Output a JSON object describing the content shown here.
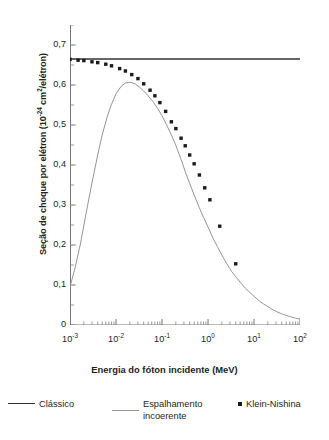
{
  "chart_data": {
    "type": "line",
    "title": "",
    "xlabel": "Energia do fóton incidente (MeV)",
    "ylabel_prefix": "Seção de choque por elétron (10",
    "ylabel_exponent": "-24",
    "ylabel_suffix": " cm2/elétron)",
    "ylabel_full": "Seção de choque por elétron (10-24 cm2/elétron)",
    "xscale": "log",
    "yscale": "linear",
    "xlim": [
      0.001,
      100
    ],
    "ylim": [
      0,
      0.75
    ],
    "grid": false,
    "legend_position": "below",
    "y_ticks": [
      {
        "value": 0,
        "label": "0"
      },
      {
        "value": 0.1,
        "label": "0,1"
      },
      {
        "value": 0.2,
        "label": "0,2"
      },
      {
        "value": 0.3,
        "label": "0,3"
      },
      {
        "value": 0.4,
        "label": "0,4"
      },
      {
        "value": 0.5,
        "label": "0,5"
      },
      {
        "value": 0.6,
        "label": "0,6"
      },
      {
        "value": 0.7,
        "label": "0,7"
      }
    ],
    "y_minor_ticks": [
      0.05,
      0.15,
      0.25,
      0.35,
      0.45,
      0.55,
      0.65,
      0.75
    ],
    "x_ticks": [
      {
        "value": 0.001,
        "mantissa": "10",
        "exponent": "-3"
      },
      {
        "value": 0.01,
        "mantissa": "10",
        "exponent": "-2"
      },
      {
        "value": 0.1,
        "mantissa": "10",
        "exponent": "-1"
      },
      {
        "value": 1,
        "mantissa": "10",
        "exponent": "0"
      },
      {
        "value": 10,
        "mantissa": "10",
        "exponent": "1"
      },
      {
        "value": 100,
        "mantissa": "10",
        "exponent": "2"
      }
    ],
    "series": [
      {
        "name": "Clássico",
        "style": "line",
        "color": "#333333",
        "width": 1.6,
        "x": [
          0.001,
          100
        ],
        "values": [
          0.665,
          0.665
        ]
      },
      {
        "name": "Espalhamento incoerente",
        "style": "line",
        "color": "#969696",
        "width": 1.0,
        "x": [
          0.001,
          0.0013,
          0.0017,
          0.0022,
          0.003,
          0.004,
          0.005,
          0.0065,
          0.008,
          0.01,
          0.013,
          0.016,
          0.02,
          0.026,
          0.033,
          0.04,
          0.05,
          0.065,
          0.08,
          0.1,
          0.13,
          0.16,
          0.2,
          0.26,
          0.33,
          0.4,
          0.5,
          0.65,
          0.8,
          1.0,
          1.3,
          1.6,
          2.0,
          2.6,
          3.3,
          4.0,
          5.0,
          6.5,
          8.0,
          10.0,
          13.0,
          16.0,
          20.0,
          26.0,
          33.0,
          40.0,
          50.0,
          65.0,
          80.0,
          100.0
        ],
        "values": [
          0.095,
          0.145,
          0.205,
          0.275,
          0.355,
          0.425,
          0.475,
          0.522,
          0.552,
          0.578,
          0.597,
          0.605,
          0.607,
          0.603,
          0.594,
          0.585,
          0.573,
          0.557,
          0.542,
          0.523,
          0.497,
          0.475,
          0.449,
          0.414,
          0.379,
          0.354,
          0.325,
          0.293,
          0.269,
          0.245,
          0.216,
          0.196,
          0.175,
          0.152,
          0.133,
          0.121,
          0.107,
          0.092,
          0.082,
          0.072,
          0.06,
          0.053,
          0.046,
          0.038,
          0.032,
          0.028,
          0.024,
          0.02,
          0.017,
          0.015
        ]
      },
      {
        "name": "Klein-Nishina",
        "style": "markers",
        "color": "#1a1a1a",
        "marker": "square",
        "marker_size": 3.4,
        "x": [
          0.001,
          0.0015,
          0.002,
          0.003,
          0.004,
          0.006,
          0.008,
          0.012,
          0.016,
          0.022,
          0.03,
          0.04,
          0.055,
          0.07,
          0.09,
          0.12,
          0.16,
          0.2,
          0.26,
          0.32,
          0.4,
          0.5,
          0.65,
          0.85,
          1.1,
          1.8,
          4.0
        ],
        "values": [
          0.664,
          0.662,
          0.661,
          0.658,
          0.656,
          0.652,
          0.648,
          0.641,
          0.635,
          0.626,
          0.616,
          0.603,
          0.587,
          0.573,
          0.556,
          0.534,
          0.508,
          0.491,
          0.467,
          0.448,
          0.425,
          0.403,
          0.375,
          0.343,
          0.313,
          0.247,
          0.153
        ]
      }
    ]
  },
  "legend": {
    "items": [
      {
        "label": "Clássico",
        "type": "line",
        "color": "#333333"
      },
      {
        "label": "Espalhamento",
        "label2": "incoerente",
        "type": "line",
        "color": "#969696"
      },
      {
        "label": "Klein-Nishina",
        "type": "marker",
        "color": "#1a1a1a"
      }
    ]
  }
}
